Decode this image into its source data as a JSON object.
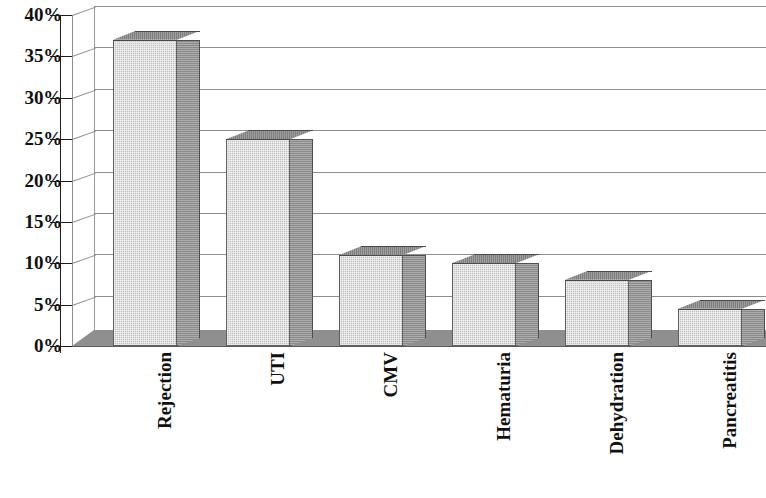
{
  "chart_data": {
    "type": "bar",
    "title": "",
    "subtitle": "",
    "xlabel": "",
    "ylabel": "",
    "categories": [
      "Rejection",
      "UTI",
      "CMV",
      "Hematuria",
      "Dehydration",
      "Pancreatitis"
    ],
    "values": [
      37,
      25,
      11,
      10,
      8,
      4.5
    ],
    "value_format": "percent",
    "ylim": [
      0,
      40
    ],
    "ytick_labels": [
      "40%",
      "35%",
      "30%",
      "25%",
      "20%",
      "15%",
      "10%",
      "5%",
      "0%"
    ],
    "ytick_values": [
      40,
      35,
      30,
      25,
      20,
      15,
      10,
      5,
      0
    ],
    "grid": true,
    "grid_axis": "y",
    "legend": false,
    "legend_position": "none",
    "style_3d": true,
    "series": [
      {
        "name": "Complication rate",
        "values": [
          37,
          25,
          11,
          10,
          8,
          4.5
        ]
      }
    ],
    "colors": {
      "bar_front": "#c2c2c2",
      "bar_side": "#8b8b8b",
      "bar_top": "#7e7e7e",
      "bar_outline": "#5f5f5f",
      "gridline": "#8d8d8d",
      "axis": "#1c1c1c",
      "floor": "#8f8f8f",
      "text": "#101010",
      "background": "#ffffff"
    }
  },
  "axis": {
    "y_ticks": [
      {
        "label": "40%",
        "value": 40
      },
      {
        "label": "35%",
        "value": 35
      },
      {
        "label": "30%",
        "value": 30
      },
      {
        "label": "25%",
        "value": 25
      },
      {
        "label": "20%",
        "value": 20
      },
      {
        "label": "15%",
        "value": 15
      },
      {
        "label": "10%",
        "value": 10
      },
      {
        "label": "5%",
        "value": 5
      },
      {
        "label": "0%",
        "value": 0
      }
    ]
  },
  "categories": [
    {
      "label": "Rejection"
    },
    {
      "label": "UTI"
    },
    {
      "label": "CMV"
    },
    {
      "label": "Hematuria"
    },
    {
      "label": "Dehydration"
    },
    {
      "label": "Pancreatitis"
    }
  ]
}
